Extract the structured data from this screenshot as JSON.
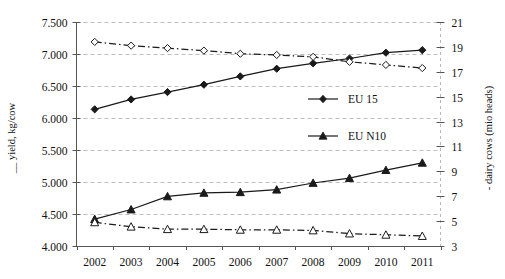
{
  "chart_data": {
    "type": "line",
    "title": "",
    "xlabel": "",
    "ylabel": "yield, kg/cow",
    "y2label": "dairy cows (mio heads)",
    "ylabel_prefix": "__",
    "y2label_prefix": "-",
    "categories": [
      "2002",
      "2003",
      "2004",
      "2005",
      "2006",
      "2007",
      "2008",
      "2009",
      "2010",
      "2011"
    ],
    "x": [
      2002,
      2003,
      2004,
      2005,
      2006,
      2007,
      2008,
      2009,
      2010,
      2011
    ],
    "ylim": [
      4.0,
      7.5
    ],
    "y2lim": [
      3,
      21
    ],
    "yticks": [
      "4.000",
      "4.500",
      "5.000",
      "5.500",
      "6.000",
      "6.500",
      "7.000",
      "7.500"
    ],
    "ytick_values": [
      4.0,
      4.5,
      5.0,
      5.5,
      6.0,
      6.5,
      7.0,
      7.5
    ],
    "y2ticks": [
      "3",
      "5",
      "7",
      "9",
      "11",
      "13",
      "15",
      "17",
      "19",
      "21"
    ],
    "y2tick_values": [
      3,
      5,
      7,
      9,
      11,
      13,
      15,
      17,
      19,
      21
    ],
    "grid": true,
    "grid_axis": "y",
    "legend_position": "center-right-inside",
    "series": [
      {
        "name": "EU 15 yield",
        "legend": "EU 15",
        "axis": "left",
        "marker": "diamond",
        "linestyle": "solid",
        "color": "#1a1a1a",
        "values": [
          6.135,
          6.29,
          6.405,
          6.52,
          6.65,
          6.77,
          6.855,
          6.93,
          7.02,
          7.06
        ]
      },
      {
        "name": "EU 15 dairy cows",
        "legend": "EU 15",
        "axis": "right",
        "marker": "diamond-open",
        "linestyle": "dashdot",
        "color": "#1a1a1a",
        "values": [
          19.4,
          19.1,
          18.9,
          18.7,
          18.45,
          18.35,
          18.2,
          17.8,
          17.55,
          17.3
        ]
      },
      {
        "name": "EU N10 yield",
        "legend": "EU N10",
        "axis": "left",
        "marker": "triangle",
        "linestyle": "solid",
        "color": "#1a1a1a",
        "values": [
          4.42,
          4.57,
          4.775,
          4.83,
          4.84,
          4.88,
          4.985,
          5.06,
          5.185,
          5.3
        ]
      },
      {
        "name": "EU N10 dairy cows",
        "legend": "EU N10",
        "axis": "right",
        "marker": "triangle-open",
        "linestyle": "dashdot",
        "color": "#1a1a1a",
        "values": [
          4.9,
          4.55,
          4.35,
          4.35,
          4.3,
          4.3,
          4.25,
          4.0,
          3.9,
          3.8
        ]
      }
    ],
    "legend_entries": [
      {
        "label": "EU 15",
        "marker": "diamond"
      },
      {
        "label": "EU N10",
        "marker": "triangle"
      }
    ]
  }
}
